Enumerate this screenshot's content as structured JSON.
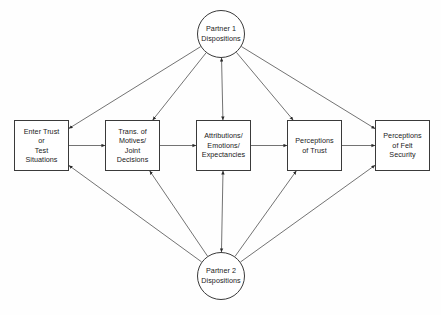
{
  "diagram": {
    "type": "path-diagram",
    "canvas": {
      "width": 441,
      "height": 315
    },
    "style": {
      "background": "#fefefe",
      "stroke": "#3a3a3a",
      "line_stroke": "#5a5a5a",
      "text_color": "#1a1a1a"
    },
    "circles": [
      {
        "id": "partner1",
        "name": "partner-1-dispositions",
        "lines": [
          "Partner 1",
          "Dispositions"
        ],
        "cx": 221,
        "cy": 34,
        "r": 24
      },
      {
        "id": "partner2",
        "name": "partner-2-dispositions",
        "lines": [
          "Partner 2",
          "Dispositions"
        ],
        "cx": 221,
        "cy": 276,
        "r": 24
      }
    ],
    "boxes": [
      {
        "id": "box1",
        "name": "enter-trust-or-test-situations",
        "lines": [
          "Enter Trust",
          "or",
          "Test",
          "Situations"
        ],
        "x": 14,
        "y": 120,
        "w": 55,
        "h": 51
      },
      {
        "id": "box2",
        "name": "transformation-of-motives-joint-decisions",
        "lines": [
          "Trans. of",
          "Motives/",
          "Joint",
          "Decisions"
        ],
        "x": 105,
        "y": 120,
        "w": 55,
        "h": 51
      },
      {
        "id": "box3",
        "name": "attributions-emotions-expectancies",
        "lines": [
          "Attributions/",
          "Emotions/",
          "Expectancies"
        ],
        "x": 196,
        "y": 120,
        "w": 55,
        "h": 51
      },
      {
        "id": "box4",
        "name": "perceptions-of-trust",
        "lines": [
          "Perceptions",
          "of Trust"
        ],
        "x": 287,
        "y": 120,
        "w": 55,
        "h": 51
      },
      {
        "id": "box5",
        "name": "perceptions-of-felt-security",
        "lines": [
          "Perceptions",
          "of Felt",
          "Security"
        ],
        "x": 375,
        "y": 120,
        "w": 55,
        "h": 51
      }
    ],
    "edges": [
      {
        "name": "edge-box1-to-box2",
        "from": "box1",
        "to": "box2",
        "arrows": "forward"
      },
      {
        "name": "edge-box2-to-box3",
        "from": "box2",
        "to": "box3",
        "arrows": "forward"
      },
      {
        "name": "edge-box3-to-box4",
        "from": "box3",
        "to": "box4",
        "arrows": "forward"
      },
      {
        "name": "edge-box4-to-box5",
        "from": "box4",
        "to": "box5",
        "arrows": "forward"
      },
      {
        "name": "edge-partner1-to-box1",
        "from": "partner1",
        "to": "box1",
        "arrows": "forward"
      },
      {
        "name": "edge-partner1-to-box2",
        "from": "partner1",
        "to": "box2",
        "arrows": "forward"
      },
      {
        "name": "edge-partner1-box3-bidirectional",
        "from": "partner1",
        "to": "box3",
        "arrows": "both"
      },
      {
        "name": "edge-partner1-to-box4",
        "from": "partner1",
        "to": "box4",
        "arrows": "forward"
      },
      {
        "name": "edge-partner1-to-box5",
        "from": "partner1",
        "to": "box5",
        "arrows": "forward"
      },
      {
        "name": "edge-partner2-to-box1",
        "from": "partner2",
        "to": "box1",
        "arrows": "forward"
      },
      {
        "name": "edge-partner2-to-box2",
        "from": "partner2",
        "to": "box2",
        "arrows": "forward"
      },
      {
        "name": "edge-partner2-box3-bidirectional",
        "from": "partner2",
        "to": "box3",
        "arrows": "both"
      },
      {
        "name": "edge-partner2-to-box4",
        "from": "partner2",
        "to": "box4",
        "arrows": "forward"
      },
      {
        "name": "edge-partner2-to-box5",
        "from": "partner2",
        "to": "box5",
        "arrows": "forward"
      }
    ]
  }
}
